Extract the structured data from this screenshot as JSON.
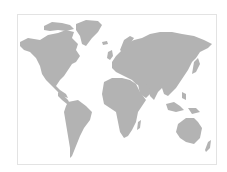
{
  "map": {
    "type": "world-map",
    "style": "gray silhouette continents on white",
    "colors": {
      "land": "#b3b3b3",
      "background": "#ffffff",
      "border": "#e3e3e3"
    },
    "regions": [
      "North America",
      "Greenland",
      "South America",
      "Europe",
      "Africa",
      "Asia",
      "Australia",
      "New Zealand",
      "Indonesia",
      "Japan",
      "United Kingdom",
      "Iceland",
      "Madagascar"
    ]
  }
}
